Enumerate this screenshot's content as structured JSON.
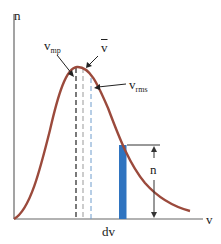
{
  "diagram": {
    "y_axis_label": "n",
    "x_axis_label": "v",
    "interval_label": "dv",
    "bar_height_label": "n",
    "markers": {
      "most_probable": {
        "base": "v",
        "sub": "mp"
      },
      "mean": {
        "base": "v",
        "bar": true
      },
      "rms": {
        "base": "v",
        "sub": "rms"
      }
    },
    "colors": {
      "curve": "#9b4a3c",
      "bar": "#2f74c0",
      "axes": "#666666",
      "dash_mp": "#222222",
      "dash_mean": "#999999",
      "dash_rms": "#6f9ccc"
    }
  }
}
